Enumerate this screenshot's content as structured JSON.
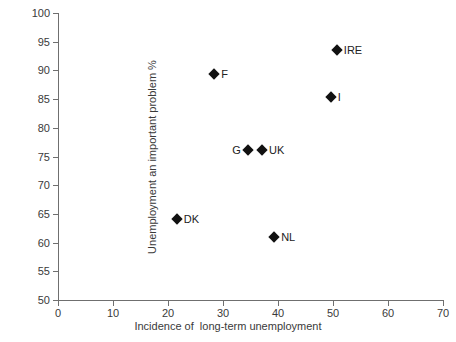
{
  "chart_data": {
    "type": "scatter",
    "title": "",
    "xlabel": "Incidence of  long-term unemployment",
    "ylabel": "Unemployment an important problem %",
    "xlim": [
      0,
      70
    ],
    "ylim": [
      50,
      100
    ],
    "xticks": [
      0,
      10,
      20,
      30,
      40,
      50,
      60,
      70
    ],
    "yticks": [
      50,
      55,
      60,
      65,
      70,
      75,
      80,
      85,
      90,
      95,
      100
    ],
    "grid": false,
    "legend": "none",
    "marker_style": "filled-diamond",
    "marker_color": "#111111",
    "points": [
      {
        "label": "DK",
        "x": 21.6,
        "y": 64.1,
        "label_side": "right"
      },
      {
        "label": "F",
        "x": 28.4,
        "y": 89.4,
        "label_side": "right"
      },
      {
        "label": "G",
        "x": 34.5,
        "y": 76.1,
        "label_side": "left"
      },
      {
        "label": "UK",
        "x": 37.1,
        "y": 76.1,
        "label_side": "right"
      },
      {
        "label": "NL",
        "x": 39.3,
        "y": 61.0,
        "label_side": "right"
      },
      {
        "label": "I",
        "x": 49.6,
        "y": 85.4,
        "label_side": "right"
      },
      {
        "label": "IRE",
        "x": 50.7,
        "y": 93.5,
        "label_side": "right"
      }
    ]
  },
  "colors": {
    "axis": "#6f6f6f",
    "text": "#3a3a3a",
    "marker": "#111111",
    "background": "#ffffff"
  }
}
